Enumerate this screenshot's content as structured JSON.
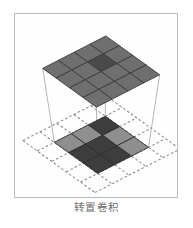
{
  "page": {
    "cutoff_text": "▔ ▔▔ ▔ ▔▔▔ ▔▔ ▔ ▔▔ ▔▔▔ ▔ ▔▔ ▔▔"
  },
  "figure": {
    "caption": "转置卷积",
    "frame_color": "#b9b9bb",
    "background": "#fefefe"
  },
  "diagram": {
    "type": "transposed-convolution",
    "output_grid": {
      "name": "output-feature-map",
      "rows": 4,
      "cols": 4,
      "base_color": "#6f6f6f",
      "cell_border_color": "#3a3a3a",
      "highlight_color": "#4a4a4a",
      "highlight_cell": {
        "row": 1,
        "col": 2
      }
    },
    "input_grid": {
      "name": "input-feature-map",
      "rows": 3,
      "cols": 3,
      "light_color": "#8e8e8e",
      "dark_color": "#3d3d3d",
      "cell_border_color": "#2b2b2b",
      "pattern": [
        [
          "light",
          "light",
          "dark"
        ],
        [
          "dark",
          "dark",
          "light"
        ],
        [
          "dark",
          "dark",
          "light"
        ]
      ]
    },
    "padding_grid": {
      "name": "zero-padding-grid",
      "rows": 5,
      "cols": 5,
      "line_color": "#8a8a8a",
      "line_style": "dashed"
    },
    "projection_lines": {
      "name": "projection-lines",
      "count": 4,
      "color": "#b0b0b0"
    }
  }
}
